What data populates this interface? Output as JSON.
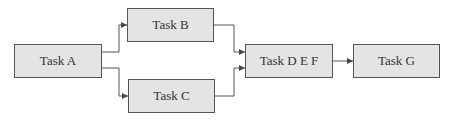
{
  "diagram": {
    "type": "flowchart",
    "nodes": [
      {
        "id": "A",
        "label": "Task A"
      },
      {
        "id": "B",
        "label": "Task B"
      },
      {
        "id": "C",
        "label": "Task C"
      },
      {
        "id": "DEF",
        "label": "Task D E F"
      },
      {
        "id": "G",
        "label": "Task G"
      }
    ],
    "edges": [
      {
        "from": "A",
        "to": "B"
      },
      {
        "from": "A",
        "to": "C"
      },
      {
        "from": "B",
        "to": "DEF"
      },
      {
        "from": "C",
        "to": "DEF"
      },
      {
        "from": "DEF",
        "to": "G"
      }
    ],
    "colors": {
      "node_fill": "#e4e4e4",
      "node_border": "#555555",
      "edge": "#444444"
    }
  }
}
